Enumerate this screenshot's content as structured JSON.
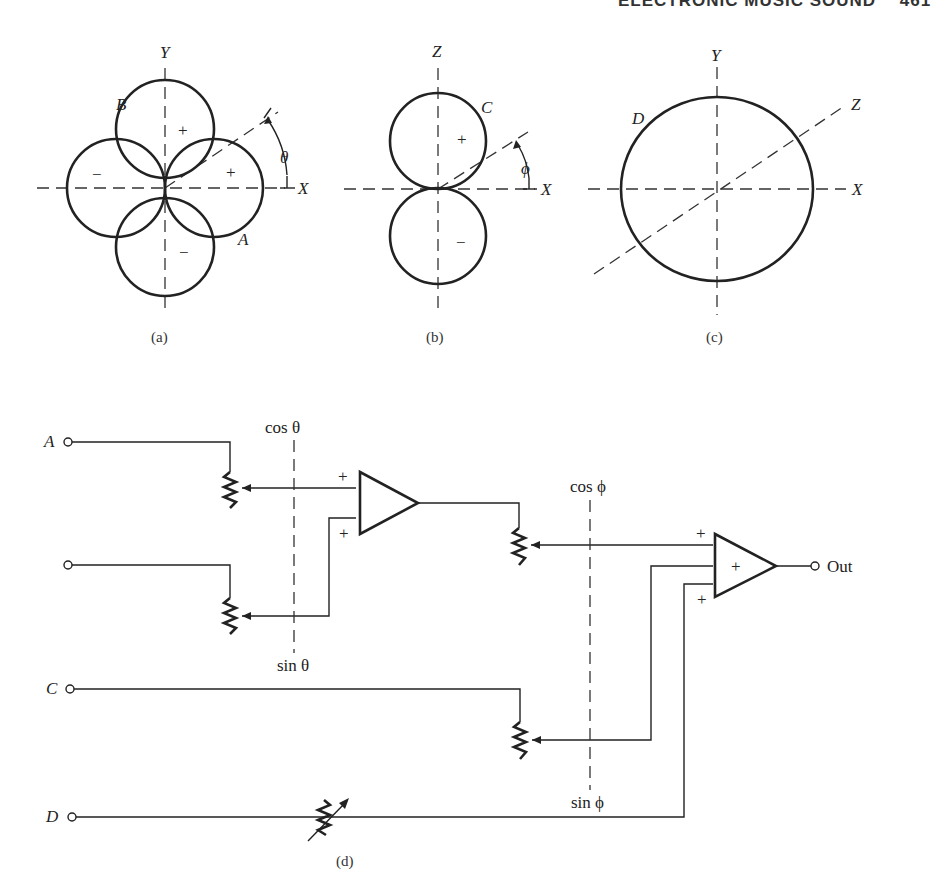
{
  "header": {
    "running_title": "ELECTRONIC MUSIC SOUND",
    "page_number": "461"
  },
  "figures": {
    "a": {
      "caption": "(a)",
      "axes": {
        "horizontal": "X",
        "vertical": "Y"
      },
      "lobe_labels": {
        "A": "A",
        "B": "B"
      },
      "signs": [
        "+",
        "+",
        "−",
        "−"
      ],
      "angle": "θ"
    },
    "b": {
      "caption": "(b)",
      "axes": {
        "horizontal": "X",
        "vertical": "Z"
      },
      "lobe_label": "C",
      "signs": [
        "+",
        "−"
      ],
      "angle": "ϕ"
    },
    "c": {
      "caption": "(c)",
      "axes": {
        "horizontal": "X",
        "vertical": "Y",
        "diagonal": "Z"
      },
      "pattern_label": "D"
    },
    "d": {
      "caption": "(d)",
      "inputs": [
        "A",
        "",
        "C",
        "D"
      ],
      "gang1": {
        "top": "cos θ",
        "bottom": "sin θ"
      },
      "gang2": {
        "top": "cos ϕ",
        "bottom": "sin ϕ"
      },
      "amp1_signs": [
        "+",
        "+"
      ],
      "amp2_signs": [
        "+",
        "+",
        "+"
      ],
      "output": "Out"
    }
  }
}
